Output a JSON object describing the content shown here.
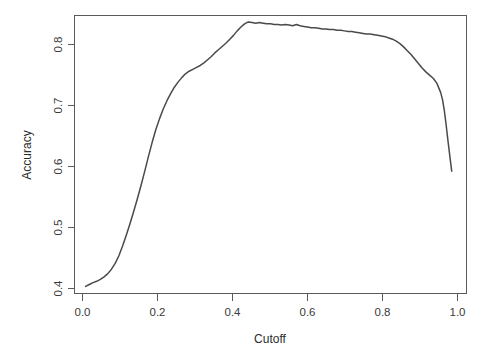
{
  "chart_data": {
    "type": "line",
    "title": "",
    "xlabel": "Cutoff",
    "ylabel": "Accuracy",
    "xlim": [
      -0.02,
      1.04
    ],
    "ylim": [
      0.392,
      0.826
    ],
    "grid": false,
    "legend": null,
    "xticks": [
      "0.0",
      "0.2",
      "0.4",
      "0.6",
      "0.8",
      "1.0"
    ],
    "xtick_values": [
      0.0,
      0.2,
      0.4,
      0.6,
      0.8,
      1.0
    ],
    "yticks": [
      "0.4",
      "0.5",
      "0.6",
      "0.7",
      "0.8"
    ],
    "ytick_values": [
      0.4,
      0.5,
      0.6,
      0.7,
      0.8
    ],
    "series": [
      {
        "name": "Accuracy vs Cutoff",
        "color": "#4a4a4a",
        "x": [
          0.01,
          0.02,
          0.03,
          0.04,
          0.05,
          0.06,
          0.07,
          0.08,
          0.09,
          0.1,
          0.11,
          0.12,
          0.13,
          0.14,
          0.15,
          0.16,
          0.17,
          0.18,
          0.19,
          0.2,
          0.21,
          0.22,
          0.23,
          0.24,
          0.25,
          0.26,
          0.27,
          0.28,
          0.29,
          0.3,
          0.31,
          0.32,
          0.33,
          0.34,
          0.35,
          0.36,
          0.37,
          0.38,
          0.39,
          0.4,
          0.41,
          0.42,
          0.43,
          0.44,
          0.45,
          0.46,
          0.47,
          0.48,
          0.49,
          0.5,
          0.51,
          0.52,
          0.53,
          0.54,
          0.55,
          0.56,
          0.57,
          0.58,
          0.59,
          0.6,
          0.61,
          0.62,
          0.63,
          0.64,
          0.65,
          0.66,
          0.67,
          0.68,
          0.69,
          0.7,
          0.71,
          0.72,
          0.73,
          0.74,
          0.75,
          0.76,
          0.77,
          0.78,
          0.79,
          0.8,
          0.81,
          0.82,
          0.83,
          0.84,
          0.85,
          0.86,
          0.87,
          0.88,
          0.89,
          0.9,
          0.91,
          0.92,
          0.93,
          0.94,
          0.95,
          0.96,
          0.97,
          0.975,
          0.98,
          0.985,
          0.99,
          0.995,
          1.0
        ],
        "y": [
          0.403,
          0.406,
          0.409,
          0.411,
          0.414,
          0.418,
          0.423,
          0.43,
          0.439,
          0.451,
          0.466,
          0.483,
          0.501,
          0.52,
          0.54,
          0.561,
          0.583,
          0.606,
          0.628,
          0.648,
          0.665,
          0.68,
          0.693,
          0.704,
          0.714,
          0.722,
          0.729,
          0.735,
          0.739,
          0.742,
          0.745,
          0.748,
          0.752,
          0.757,
          0.762,
          0.768,
          0.773,
          0.778,
          0.783,
          0.789,
          0.795,
          0.802,
          0.808,
          0.813,
          0.816,
          0.815,
          0.814,
          0.815,
          0.814,
          0.813,
          0.813,
          0.812,
          0.812,
          0.811,
          0.812,
          0.811,
          0.81,
          0.812,
          0.81,
          0.809,
          0.808,
          0.807,
          0.807,
          0.806,
          0.805,
          0.805,
          0.804,
          0.804,
          0.803,
          0.803,
          0.802,
          0.801,
          0.801,
          0.8,
          0.799,
          0.798,
          0.797,
          0.797,
          0.796,
          0.795,
          0.794,
          0.793,
          0.791,
          0.789,
          0.786,
          0.782,
          0.777,
          0.771,
          0.765,
          0.758,
          0.751,
          0.744,
          0.738,
          0.733,
          0.728,
          0.72,
          0.706,
          0.695,
          0.678,
          0.655,
          0.63,
          0.606,
          0.583
        ]
      }
    ]
  },
  "axes": {
    "y_title": "Accuracy",
    "x_title": "Cutoff"
  }
}
